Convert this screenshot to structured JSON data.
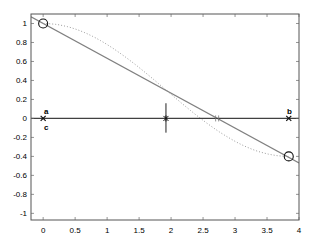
{
  "chart_data": {
    "type": "line",
    "title": "",
    "xlabel": "",
    "ylabel": "",
    "xlim": [
      -0.19,
      4
    ],
    "ylim": [
      -1.07,
      1.1
    ],
    "grid": false,
    "legend": null,
    "x_ticks": [
      0,
      0.5,
      1,
      1.5,
      2,
      2.5,
      3,
      3.5,
      4
    ],
    "x_tick_labels": [
      "0",
      "0.5",
      "1",
      "1.5",
      "2",
      "2.5",
      "3",
      "3.5",
      "4"
    ],
    "y_ticks": [
      1,
      0.8,
      0.6,
      0.4,
      0.2,
      0,
      -0.2,
      -0.4,
      -0.6,
      -0.8,
      -1
    ],
    "y_tick_labels": [
      "1",
      "0.8",
      "0.6",
      "0.4",
      "0.2",
      "0",
      "-0.2",
      "-0.4",
      "-0.6",
      "-0.8",
      "-1"
    ],
    "series": [
      {
        "name": "straight-line",
        "style": "solid",
        "color": "#808080",
        "x": [
          -0.19,
          4
        ],
        "y": [
          1.07,
          -0.47
        ]
      },
      {
        "name": "dotted-curve",
        "style": "dotted",
        "color": "#909090",
        "x": [
          0,
          0.5,
          1,
          1.5,
          2,
          2.5,
          3,
          3.5,
          3.84
        ],
        "y": [
          1.0,
          0.94,
          0.77,
          0.53,
          0.26,
          -0.02,
          -0.25,
          -0.39,
          -0.4
        ]
      },
      {
        "name": "horizontal-axis-line",
        "style": "solid",
        "color": "#404040",
        "x": [
          -0.19,
          4
        ],
        "y": [
          0,
          0
        ]
      }
    ],
    "markers": [
      {
        "name": "start-circle",
        "shape": "circle",
        "x": 0,
        "y": 1
      },
      {
        "name": "end-circle",
        "shape": "circle",
        "x": 3.84,
        "y": -0.4
      },
      {
        "name": "point-a-cross",
        "shape": "x",
        "x": 0,
        "y": 0
      },
      {
        "name": "point-b-cross",
        "shape": "x",
        "x": 3.84,
        "y": 0
      },
      {
        "name": "mid-star",
        "shape": "star",
        "x": 1.92,
        "y": 0
      },
      {
        "name": "zero-crossing-tick",
        "shape": "plus",
        "x": 2.72,
        "y": 0
      }
    ],
    "vertical_segment": {
      "x": 1.92,
      "y_from": 0.16,
      "y_to": -0.15
    },
    "annotations": [
      {
        "text": "a",
        "x": 0.05,
        "y": 0.08
      },
      {
        "text": "b",
        "x": 3.85,
        "y": 0.08
      },
      {
        "text": "c",
        "x": 0.05,
        "y": -0.09
      }
    ]
  }
}
